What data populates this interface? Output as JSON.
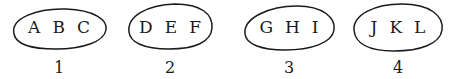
{
  "diagram": {
    "groups": [
      {
        "letters": [
          "A",
          "B",
          "C"
        ],
        "label": "1"
      },
      {
        "letters": [
          "D",
          "E",
          "F"
        ],
        "label": "2"
      },
      {
        "letters": [
          "G",
          "H",
          "I"
        ],
        "label": "3"
      },
      {
        "letters": [
          "J",
          "K",
          "L"
        ],
        "label": "4"
      }
    ],
    "stroke_color": "#1a1a1a"
  }
}
